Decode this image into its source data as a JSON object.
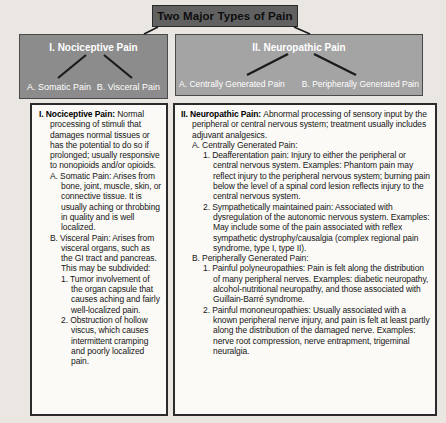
{
  "title_box": {
    "label": "Two Major Types of Pain"
  },
  "colors": {
    "page_bg": "#eae7e2",
    "title_bg": "#616161",
    "title_text": "#0e0e0e",
    "left_header_bg": "#8c8c8c",
    "right_header_bg": "#a4a4a4",
    "header_text": "#ffffff",
    "box_bg": "#fbfaf7",
    "border_dark": "#2b2b2b",
    "border_mid": "#4a4a4a",
    "line_color": "#1a1a1a",
    "body_text": "#161616"
  },
  "nociceptive": {
    "header": "I. Nociceptive Pain",
    "branch_a": "A. Somatic Pain",
    "branch_b": "B. Visceral Pain",
    "outline": [
      {
        "indent": 0,
        "marker": "I.",
        "bold": "Nociceptive Pain:",
        "text": "Normal processing of stimuli that damages normal tissues or has the potential to do so if prolonged; usually responsive to nonopioids and/or opioids."
      },
      {
        "indent": 1,
        "marker": "A.",
        "bold": "",
        "text": "Somatic Pain: Arises from bone, joint, muscle, skin, or connective tissue. It is usually aching or throbbing in quality and is well localized."
      },
      {
        "indent": 1,
        "marker": "B.",
        "bold": "",
        "text": "Visceral Pain: Arises from visceral organs, such as the GI tract and pancreas. This may be subdivided:"
      },
      {
        "indent": 2,
        "marker": "1.",
        "bold": "",
        "text": "Tumor involvement of the organ capsule that causes aching and fairly well-localized pain."
      },
      {
        "indent": 2,
        "marker": "2.",
        "bold": "",
        "text": "Obstruction of hollow viscus, which causes intermittent cramping and poorly localized pain."
      }
    ]
  },
  "neuropathic": {
    "header": "II. Neuropathic Pain",
    "branch_a": "A. Centrally Generated Pain",
    "branch_b": "B. Peripherally Generated Pain",
    "outline": [
      {
        "indent": 0,
        "marker": "II.",
        "bold": "Neuropathic Pain:",
        "text": "Abnormal processing of sensory input by the peripheral or central nervous system; treatment usually includes adjuvant analgesics."
      },
      {
        "indent": 1,
        "marker": "A.",
        "bold": "",
        "text": "Centrally Generated Pain:"
      },
      {
        "indent": 2,
        "marker": "1.",
        "bold": "",
        "text": "Deafferentation pain: Injury to either the peripheral or central nervous system. Examples: Phantom pain may reflect injury to the peripheral nervous system; burning pain below the level of a spinal cord lesion reflects injury to the central nervous system."
      },
      {
        "indent": 2,
        "marker": "2.",
        "bold": "",
        "text": "Sympathetically maintained pain: Associated with dysregulation of the autonomic nervous system. Examples: May include some of the pain associated with reflex sympathetic dystrophy/causalgia (complex regional pain syndrome, type I, type II)."
      },
      {
        "indent": 1,
        "marker": "B.",
        "bold": "",
        "text": "Peripherally Generated Pain:"
      },
      {
        "indent": 2,
        "marker": "1.",
        "bold": "",
        "text": "Painful polyneuropathies: Pain is felt along the distribution of many peripheral nerves. Examples: diabetic neuropathy, alcohol-nutritional neuropathy, and those associated with Guillain-Barré syndrome."
      },
      {
        "indent": 2,
        "marker": "2.",
        "bold": "",
        "text": "Painful mononeuropathies: Usually associated with a known peripheral nerve injury, and pain is felt at least partly along the distribution of the damaged nerve. Examples: nerve root compression, nerve entrapment, trigeminal neuralgia."
      }
    ]
  }
}
